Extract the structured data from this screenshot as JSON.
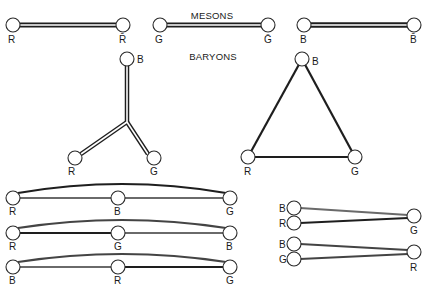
{
  "headings": {
    "mesons": "MESONS",
    "baryons": "BARYONS"
  },
  "mesons": [
    {
      "left": "R",
      "right": "R̄"
    },
    {
      "left": "G",
      "right": "Ḡ"
    },
    {
      "left": "B",
      "right": "B̄"
    }
  ],
  "baryon_y": {
    "top": "B",
    "left": "R",
    "right": "G"
  },
  "baryon_triangle": {
    "top": "B",
    "left": "R",
    "right": "G"
  },
  "linear_baryons": [
    {
      "left": "R",
      "middle": "B",
      "right": "G"
    },
    {
      "left": "R",
      "middle": "G",
      "right": "B"
    },
    {
      "left": "B",
      "middle": "R",
      "right": "G"
    }
  ],
  "diquark_baryons": [
    {
      "pair_top": "B",
      "pair_bottom": "R",
      "single": "G"
    },
    {
      "pair_top": "B",
      "pair_bottom": "G",
      "single": "R"
    }
  ],
  "colors": {
    "ink": "#1e1e1e",
    "gray_string": "#6a6a6a",
    "background": "#ffffff"
  }
}
